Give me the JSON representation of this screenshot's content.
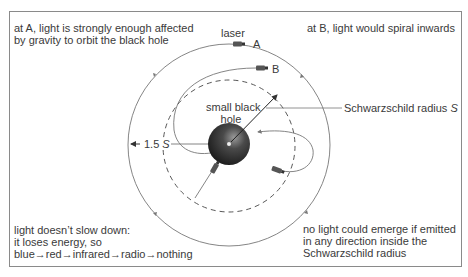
{
  "annotations": {
    "top_left": [
      "at A, light is strongly enough affected",
      "by gravity to orbit the black hole"
    ],
    "top_right": "at B, light would spiral inwards",
    "bottom_left": [
      "light doesn’t slow down:",
      "it loses energy, so",
      "blue→red→infrared→radio→nothing"
    ],
    "bottom_right": [
      "no light could emerge if emitted",
      "in any direction inside the",
      "Schwarzschild radius"
    ]
  },
  "labels": {
    "laser": "laser",
    "point_a": "A",
    "point_b": "B",
    "black_hole_line1": "small black",
    "black_hole_line2": "hole",
    "schwarzschild": "Schwarzschild radius ",
    "schwarzschild_symbol": "S",
    "radius_factor": "1.5",
    "radius_symbol": "S"
  },
  "colors": {
    "line": "#6e6e6e",
    "text": "#3a3a3a",
    "hole_dark": "#1e1e1e",
    "hole_light": "#8a8a8a",
    "frame": "#8a8a8a"
  }
}
